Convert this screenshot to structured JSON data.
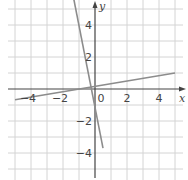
{
  "chart_data": {
    "type": "line",
    "title": "",
    "xlabel": "x",
    "ylabel": "y",
    "xlim": [
      -5.5,
      5.5
    ],
    "ylim": [
      -5.5,
      5.5
    ],
    "grid": true,
    "x_ticks": [
      {
        "value": -4,
        "label": "−4"
      },
      {
        "value": -2,
        "label": "−2"
      },
      {
        "value": 0,
        "label": "0"
      },
      {
        "value": 2,
        "label": "2"
      },
      {
        "value": 4,
        "label": "4"
      }
    ],
    "y_ticks": [
      {
        "value": 4,
        "label": "4"
      },
      {
        "value": 2,
        "label": "2"
      },
      {
        "value": -2,
        "label": "−2"
      },
      {
        "value": -4,
        "label": "−4"
      }
    ],
    "series": [
      {
        "name": "steep line",
        "equation": "y = -5x - 1",
        "x": [
          -1.4,
          0.5
        ],
        "y": [
          6.0,
          -3.7
        ]
      },
      {
        "name": "shallow line",
        "equation": "y = (x + 1) / 6",
        "x": [
          -5.0,
          5.0
        ],
        "y": [
          -0.67,
          1.0
        ]
      }
    ],
    "colors": {
      "grid": "#d4d4d4",
      "axes": "#444444",
      "lines": "#8c8c8c"
    }
  }
}
